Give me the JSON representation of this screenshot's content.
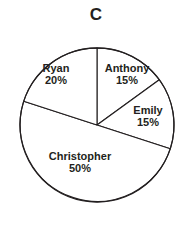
{
  "chart_data": {
    "type": "pie",
    "title": "C",
    "xlabel": "",
    "ylabel": "",
    "legend": "none",
    "grid": false,
    "start_angle_deg": 0,
    "direction": "clockwise",
    "categories": [
      "Anthony",
      "Emily",
      "Christopher",
      "Ryan"
    ],
    "values": [
      15,
      15,
      50,
      20
    ],
    "unit": "%",
    "slices": [
      {
        "label": "Anthony",
        "value": 15,
        "value_text": "15%",
        "start_deg": 0,
        "end_deg": 54,
        "color": "#ffffff"
      },
      {
        "label": "Emily",
        "value": 15,
        "value_text": "15%",
        "start_deg": 54,
        "end_deg": 108,
        "color": "#ffffff"
      },
      {
        "label": "Christopher",
        "value": 50,
        "value_text": "50%",
        "start_deg": 108,
        "end_deg": 288,
        "color": "#ffffff"
      },
      {
        "label": "Ryan",
        "value": 20,
        "value_text": "20%",
        "start_deg": 288,
        "end_deg": 360,
        "color": "#ffffff"
      }
    ],
    "total": 100,
    "stroke_color": "#231f20",
    "background_color": "#ffffff"
  },
  "title": {
    "text": "C"
  },
  "labels": {
    "ryan": {
      "name": "Ryan",
      "pct": "20%"
    },
    "anthony": {
      "name": "Anthony",
      "pct": "15%"
    },
    "emily": {
      "name": "Emily",
      "pct": "15%"
    },
    "christopher": {
      "name": "Christopher",
      "pct": "50%"
    }
  }
}
